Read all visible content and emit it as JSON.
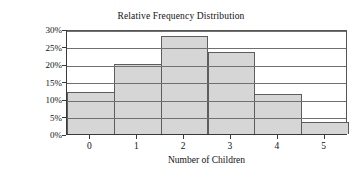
{
  "chart_data": {
    "type": "bar",
    "title": "Relative Frequency Distribution",
    "xlabel": "Number of Children",
    "ylabel": "Relative Frequency",
    "categories": [
      "0",
      "1",
      "2",
      "3",
      "4",
      "5"
    ],
    "values": [
      12,
      20,
      28,
      23.5,
      11.5,
      3.5
    ],
    "value_unit": "%",
    "ylim": [
      0,
      30
    ],
    "ytick_values": [
      0,
      5,
      10,
      15,
      20,
      25,
      30
    ],
    "ytick_labels": [
      "0%",
      "5%",
      "10%",
      "15%",
      "20%",
      "25%",
      "30%"
    ],
    "xtick_labels": [
      "0",
      "1",
      "2",
      "3",
      "4",
      "5"
    ],
    "grid": "horizontal",
    "legend": null,
    "bar_style": "contiguous-histogram",
    "colors": {
      "bar_fill": "#d6d6d6",
      "bar_border": "#5d5d5d",
      "gridline": "#707070",
      "axis": "#3a3a3a",
      "text": "#111111",
      "background": "#ffffff"
    }
  }
}
